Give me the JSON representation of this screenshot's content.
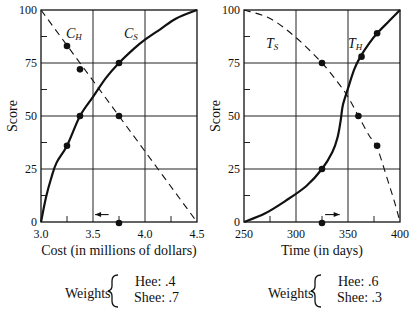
{
  "chart_data": [
    {
      "type": "line",
      "title": "",
      "xlabel": "Cost (in millions of dollars)",
      "ylabel": "Score",
      "xlim": [
        3.0,
        4.5
      ],
      "ylim": [
        0,
        100
      ],
      "xticks": [
        "3.0",
        "3.5",
        "4.0",
        "4.5"
      ],
      "yticks": [
        "0",
        "25",
        "50",
        "75",
        "100"
      ],
      "grid": true,
      "series": [
        {
          "name": "C_H",
          "label_main": "C",
          "label_sub": "H",
          "style": "solid",
          "points": [
            [
              3.0,
              0
            ],
            [
              3.05,
              12
            ],
            [
              3.1,
              21
            ],
            [
              3.15,
              28
            ],
            [
              3.25,
              36
            ],
            [
              3.375,
              50
            ],
            [
              3.5,
              59
            ],
            [
              3.625,
              68
            ],
            [
              3.75,
              75
            ],
            [
              3.9,
              82
            ],
            [
              4.0,
              86
            ],
            [
              4.15,
              91
            ],
            [
              4.3,
              96
            ],
            [
              4.5,
              100
            ]
          ],
          "markers": [
            [
              3.25,
              36
            ],
            [
              3.375,
              50
            ],
            [
              3.75,
              75
            ]
          ]
        },
        {
          "name": "C_S",
          "label_main": "C",
          "label_sub": "S",
          "style": "dashed",
          "points": [
            [
              3.0,
              100
            ],
            [
              4.5,
              0
            ]
          ],
          "markers": [
            [
              3.25,
              83
            ],
            [
              3.375,
              72
            ],
            [
              3.75,
              50
            ]
          ]
        }
      ],
      "annotations": [
        {
          "type": "dot",
          "x": 3.75,
          "y": 0
        },
        {
          "type": "arrow",
          "direction": "left",
          "x_from": 3.65,
          "x_to": 3.52,
          "y": 3.5
        }
      ],
      "weights": {
        "label": "Weights",
        "hee": "Hee: .4",
        "shee": "Shee: .7"
      }
    },
    {
      "type": "line",
      "title": "",
      "xlabel": "Time (in days)",
      "ylabel": "Score",
      "xlim": [
        250,
        400
      ],
      "ylim": [
        0,
        100
      ],
      "xticks": [
        "250",
        "300",
        "350",
        "400"
      ],
      "yticks": [
        "0",
        "25",
        "50",
        "75",
        "100"
      ],
      "grid": true,
      "series": [
        {
          "name": "T_H",
          "label_main": "T",
          "label_sub": "H",
          "style": "solid",
          "points": [
            [
              250,
              0
            ],
            [
              270,
              4
            ],
            [
              290,
              10
            ],
            [
              310,
              17
            ],
            [
              325,
              25
            ],
            [
              335,
              33
            ],
            [
              340,
              40
            ],
            [
              343,
              48
            ],
            [
              345,
              55
            ],
            [
              350,
              63
            ],
            [
              356,
              72
            ],
            [
              362,
              78
            ],
            [
              370,
              84
            ],
            [
              378,
              89
            ],
            [
              390,
              95
            ],
            [
              400,
              100
            ]
          ],
          "markers": [
            [
              325,
              25
            ],
            [
              363,
              78
            ],
            [
              378,
              89
            ]
          ]
        },
        {
          "name": "T_S",
          "label_main": "T",
          "label_sub": "S",
          "style": "dashed",
          "points": [
            [
              250,
              100
            ],
            [
              275,
              96
            ],
            [
              300,
              87
            ],
            [
              325,
              75
            ],
            [
              340,
              66
            ],
            [
              350,
              59
            ],
            [
              360,
              50
            ],
            [
              370,
              41
            ],
            [
              378,
              35
            ],
            [
              388,
              20
            ],
            [
              395,
              9
            ],
            [
              400,
              0
            ]
          ],
          "markers": [
            [
              325,
              75
            ],
            [
              360,
              50
            ],
            [
              378,
              36
            ]
          ]
        }
      ],
      "annotations": [
        {
          "type": "dot",
          "x": 325,
          "y": 0
        },
        {
          "type": "arrow",
          "direction": "right",
          "x_from": 328,
          "x_to": 342,
          "y": 3.5
        }
      ],
      "weights": {
        "label": "Weights",
        "hee": "Hee: .6",
        "shee": "Shee: .3"
      }
    }
  ]
}
